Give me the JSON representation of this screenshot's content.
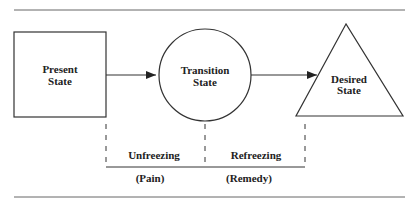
{
  "diagram": {
    "nodes": [
      {
        "id": "present",
        "shape": "square",
        "line1": "Present",
        "line2": "State"
      },
      {
        "id": "transition",
        "shape": "circle",
        "line1": "Transition",
        "line2": "State"
      },
      {
        "id": "desired",
        "shape": "triangle",
        "line1": "Desired",
        "line2": "State"
      }
    ],
    "edges": [
      {
        "from": "present",
        "to": "transition"
      },
      {
        "from": "transition",
        "to": "desired"
      }
    ],
    "phases": [
      {
        "label": "Unfreezing",
        "sublabel": "(Pain)"
      },
      {
        "label": "Refreezing",
        "sublabel": "(Remedy)"
      }
    ],
    "colors": {
      "line": "#333333",
      "background": "#ffffff"
    }
  }
}
